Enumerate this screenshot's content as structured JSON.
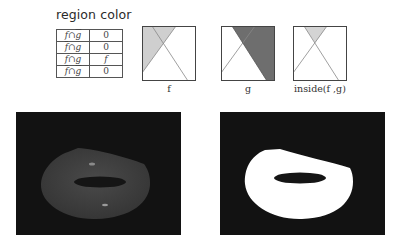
{
  "header": {
    "title": "region color"
  },
  "table": {
    "rows": [
      {
        "region_f": "f",
        "op": "∩",
        "region_g": "g",
        "f_bar": false,
        "g_bar": true,
        "color": "0"
      },
      {
        "region_f": "f",
        "op": "∩",
        "region_g": "g",
        "f_bar": true,
        "g_bar": false,
        "color": "0"
      },
      {
        "region_f": "f",
        "op": "∩",
        "region_g": "g",
        "f_bar": false,
        "g_bar": false,
        "color": "f"
      },
      {
        "region_f": "f",
        "op": "∩",
        "region_g": "g",
        "f_bar": true,
        "g_bar": true,
        "color": "0"
      }
    ]
  },
  "panels": [
    {
      "label": "f",
      "fill": "#cfcfcf"
    },
    {
      "label": "g",
      "fill": "#6e6e6e"
    },
    {
      "label": "inside(f ,g)",
      "fill": "#d4d4d4"
    }
  ],
  "renders": [
    {
      "name": "shaded-torus",
      "background": "#121212",
      "shape_color": "#3c3c3c"
    },
    {
      "name": "mask-torus",
      "background": "#121212",
      "shape_color": "#ffffff"
    }
  ]
}
